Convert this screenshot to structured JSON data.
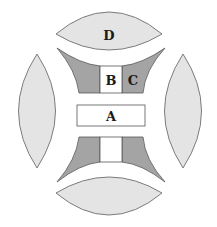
{
  "diagram": {
    "labels": {
      "A": "A",
      "B": "B",
      "C": "C",
      "D": "D"
    },
    "colors": {
      "lens_fill": "#e4e4e4",
      "dark_fill": "#a4a4a4",
      "white_fill": "#ffffff",
      "outline": "#6e6e6e",
      "text": "#1a1a1a"
    }
  }
}
